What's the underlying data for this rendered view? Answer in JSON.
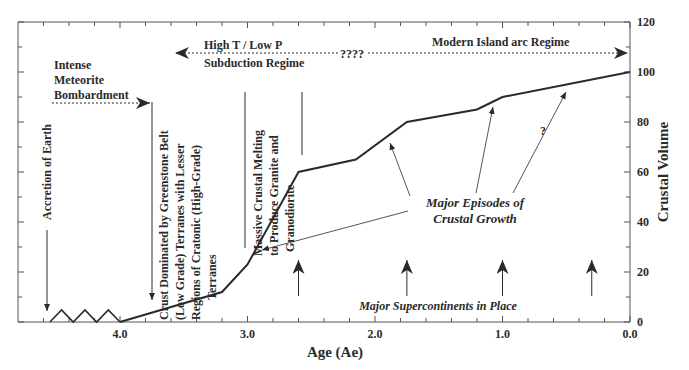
{
  "chart_data": {
    "type": "line",
    "title": "",
    "xlabel": "Age (Ae)",
    "ylabel": "Crustal Volume",
    "xlim": [
      4.8,
      0.0
    ],
    "ylim": [
      0,
      120
    ],
    "x_reversed": true,
    "x_ticks": [
      "4.0",
      "3.0",
      "2.0",
      "1.0",
      "0.0"
    ],
    "y_ticks": [
      "0",
      "20",
      "40",
      "60",
      "80",
      "100",
      "120"
    ],
    "y_axis_position": "right",
    "grid": false,
    "legend": null,
    "series": [
      {
        "name": "Crustal Volume",
        "x": [
          4.0,
          3.2,
          3.0,
          2.6,
          2.15,
          1.75,
          1.2,
          1.0,
          0.0
        ],
        "y": [
          0,
          12,
          23,
          60,
          65,
          80,
          85,
          90,
          100
        ]
      }
    ],
    "pre_crust_zigzag": {
      "x_range": [
        4.55,
        4.0
      ],
      "amplitude": 4
    },
    "annotations": {
      "accretion": "Accretion of Earth",
      "bombardment": [
        "Intense",
        "Meteorite",
        "Bombardment"
      ],
      "greenstone": [
        "Crust Dominated by Greenstone Belt",
        "(Low Grade) Terranes with Lesser",
        "Regions of Cratonic (High-Grade)",
        "Terranes"
      ],
      "melting": [
        "Massive Crustal Melting",
        "to Produce Granite and",
        "Granodiorite"
      ],
      "regime_left": [
        "High T / Low P",
        "Subduction Regime"
      ],
      "regime_unknown": "????",
      "regime_right": "Modern Island arc Regime",
      "growth": [
        "Major Episodes of",
        "Crustal Growth"
      ],
      "growth_question": "?",
      "supercontinents": "Major Supercontinents in Place",
      "supercontinent_ages": [
        2.6,
        1.75,
        1.0,
        0.3
      ]
    }
  }
}
